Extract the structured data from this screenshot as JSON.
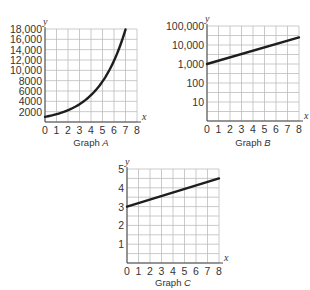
{
  "chart_data": [
    {
      "id": "A",
      "type": "line",
      "title": "",
      "caption_text": "Graph ",
      "caption_letter": "A",
      "xlabel": "x",
      "ylabel": "y",
      "xlim": [
        0,
        8
      ],
      "ylim": [
        0,
        18000
      ],
      "yscale": "linear",
      "x_ticks": [
        "0",
        "1",
        "2",
        "3",
        "4",
        "5",
        "6",
        "7",
        "8"
      ],
      "y_ticks": [
        {
          "value": 2000,
          "label": "2000"
        },
        {
          "value": 4000,
          "label": "4000"
        },
        {
          "value": 6000,
          "label": "6000"
        },
        {
          "value": 8000,
          "label": "8000"
        },
        {
          "value": 10000,
          "label": "10,000"
        },
        {
          "value": 12000,
          "label": "12,000"
        },
        {
          "value": 14000,
          "label": "14,000"
        },
        {
          "value": 16000,
          "label": "16,000"
        },
        {
          "value": 18000,
          "label": "18,000"
        }
      ],
      "grid": true,
      "series": [
        {
          "name": "Graph A curve",
          "x": [
            0,
            1,
            2,
            3,
            4,
            5,
            6,
            7
          ],
          "y": [
            1000,
            1510,
            2280,
            3440,
            5200,
            7850,
            11850,
            17900
          ]
        }
      ]
    },
    {
      "id": "B",
      "type": "line",
      "title": "",
      "caption_text": "Graph ",
      "caption_letter": "B",
      "xlabel": "x",
      "ylabel": "y",
      "xlim": [
        0,
        8
      ],
      "ylim": [
        1,
        100000
      ],
      "yscale": "log",
      "x_ticks": [
        "0",
        "1",
        "2",
        "3",
        "4",
        "5",
        "6",
        "7",
        "8"
      ],
      "y_ticks": [
        {
          "value": 10,
          "label": "10"
        },
        {
          "value": 100,
          "label": "100"
        },
        {
          "value": 1000,
          "label": "1,000"
        },
        {
          "value": 10000,
          "label": "10,000"
        },
        {
          "value": 100000,
          "label": "100,000"
        }
      ],
      "grid": true,
      "series": [
        {
          "name": "Graph B line",
          "x": [
            0,
            8
          ],
          "y": [
            1000,
            25000
          ]
        }
      ]
    },
    {
      "id": "C",
      "type": "line",
      "title": "",
      "caption_text": "Graph ",
      "caption_letter": "C",
      "xlabel": "x",
      "ylabel": "y",
      "xlim": [
        0,
        8
      ],
      "ylim": [
        0,
        5
      ],
      "yscale": "linear",
      "x_ticks": [
        "0",
        "1",
        "2",
        "3",
        "4",
        "5",
        "6",
        "7",
        "8"
      ],
      "y_ticks": [
        {
          "value": 1,
          "label": "1"
        },
        {
          "value": 2,
          "label": "2"
        },
        {
          "value": 3,
          "label": "3"
        },
        {
          "value": 4,
          "label": "4"
        },
        {
          "value": 5,
          "label": "5"
        }
      ],
      "grid": true,
      "series": [
        {
          "name": "Graph C line",
          "x": [
            0,
            8
          ],
          "y": [
            3,
            4.5
          ]
        }
      ]
    }
  ]
}
